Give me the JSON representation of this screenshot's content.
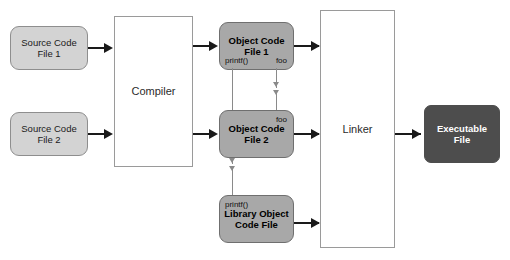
{
  "diagram": {
    "title_text": "",
    "colors": {
      "source_fill": "#d3d3d3",
      "object_fill": "#a8a8a8",
      "process_fill": "#ffffff",
      "executable_fill": "#4d4d4d",
      "arrow": "#1a1a1a",
      "reference_line": "#8a8a8a",
      "background": "#ffffff"
    },
    "nodes": {
      "source_file_1": {
        "line1": "Source Code",
        "line2": "File 1"
      },
      "source_file_2": {
        "line1": "Source Code",
        "line2": "File 2"
      },
      "compiler": {
        "label": "Compiler"
      },
      "object_file_1": {
        "line1": "Object Code",
        "line2": "File 1",
        "symbol_defined": "printf()",
        "symbol_unresolved": "foo"
      },
      "object_file_2": {
        "line1": "Object Code",
        "line2": "File 2",
        "symbol_defined": "foo"
      },
      "library_object_file": {
        "line1": "Library Object",
        "line2": "Code File",
        "symbol_defined": "printf()"
      },
      "linker": {
        "label": "Linker"
      },
      "executable_file": {
        "line1": "Executable",
        "line2": "File"
      }
    }
  }
}
